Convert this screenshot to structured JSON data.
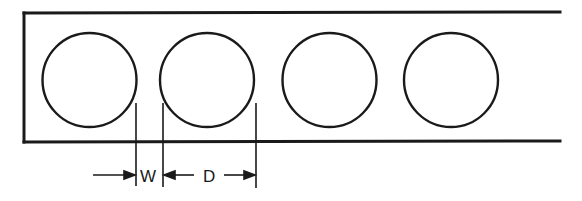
{
  "diagram": {
    "hole_count": 4,
    "labels": {
      "web_width": "W",
      "diameter": "D"
    },
    "colors": {
      "stroke": "#1a1a1a",
      "background": "#ffffff"
    }
  }
}
